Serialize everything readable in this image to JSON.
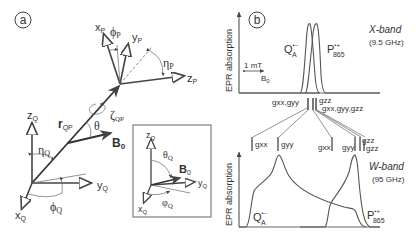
{
  "panel_a": {
    "label": "a",
    "frame_P": {
      "x": "x",
      "y": "y",
      "z": "z",
      "sub": "P",
      "phi": "ϕ",
      "eta": "η"
    },
    "frame_Q": {
      "x": "x",
      "y": "y",
      "z": "z",
      "sub": "Q",
      "phi": "ϕ",
      "eta": "η"
    },
    "r_label": "r",
    "r_sub": "QP",
    "zeta": "ζ",
    "zeta_sub": "QP",
    "theta": "θ",
    "B0": "B",
    "B0_sub": "0",
    "inset": {
      "theta": "θ",
      "theta_sub": "Q",
      "phi": "φ",
      "phi_sub": "Q",
      "B0": "B",
      "B0_sub": "0",
      "x": "x",
      "y": "y",
      "z": "z",
      "sub": "Q"
    }
  },
  "panel_b": {
    "label": "b",
    "ylabel": "EPR absorption",
    "xband": {
      "title": "X-band",
      "freq": "(9.5 GHz)",
      "scale": "1 mT",
      "field": "B",
      "field_sub": "0",
      "Q": "Q",
      "Q_sup": "•–",
      "Q_sub": "A",
      "P": "P",
      "P_sup": "•+",
      "P_sub": "865",
      "g_left": "gxx,gyy",
      "g_right_top": "gzz",
      "g_right": "gxx,gyy,gzz"
    },
    "wband": {
      "title": "W-band",
      "freq": "(95 GHz)",
      "Q": "Q",
      "Q_sup": "•–",
      "Q_sub": "A",
      "P": "P",
      "P_sup": "•+",
      "P_sub": "865",
      "g_markers": [
        "gxx",
        "gyy",
        "gzz",
        "gxx",
        "gyy",
        "gzz"
      ]
    }
  }
}
